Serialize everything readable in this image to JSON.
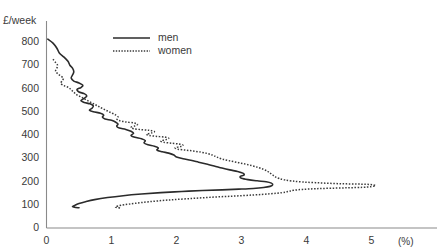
{
  "top_caption": "",
  "chart_data": {
    "type": "line",
    "title": "",
    "xlabel": "(%)",
    "ylabel": "£/week",
    "xlim": [
      0,
      5.6
    ],
    "ylim": [
      0,
      850
    ],
    "grid": false,
    "legend_position": "top-center",
    "x_ticks": [
      {
        "value": 0,
        "label": "0"
      },
      {
        "value": 1,
        "label": "1"
      },
      {
        "value": 2,
        "label": "2"
      },
      {
        "value": 3,
        "label": "3"
      },
      {
        "value": 4,
        "label": "4"
      },
      {
        "value": 5,
        "label": "5"
      }
    ],
    "y_ticks": [
      {
        "value": 0,
        "label": "0"
      },
      {
        "value": 100,
        "label": "100"
      },
      {
        "value": 200,
        "label": "200"
      },
      {
        "value": 300,
        "label": "300"
      },
      {
        "value": 400,
        "label": "400"
      },
      {
        "value": 500,
        "label": "500"
      },
      {
        "value": 600,
        "label": "600"
      },
      {
        "value": 700,
        "label": "700"
      },
      {
        "value": 800,
        "label": "800"
      }
    ],
    "series": [
      {
        "name": "men",
        "style": "solid",
        "color": "#2b2b2b",
        "points": [
          [
            0.02,
            812
          ],
          [
            0.1,
            795
          ],
          [
            0.16,
            773
          ],
          [
            0.2,
            752
          ],
          [
            0.27,
            735
          ],
          [
            0.33,
            717
          ],
          [
            0.36,
            700
          ],
          [
            0.4,
            688
          ],
          [
            0.42,
            672
          ],
          [
            0.4,
            658
          ],
          [
            0.38,
            645
          ],
          [
            0.42,
            632
          ],
          [
            0.5,
            624
          ],
          [
            0.56,
            614
          ],
          [
            0.53,
            604
          ],
          [
            0.47,
            596
          ],
          [
            0.5,
            585
          ],
          [
            0.58,
            578
          ],
          [
            0.62,
            568
          ],
          [
            0.58,
            558
          ],
          [
            0.53,
            548
          ],
          [
            0.58,
            540
          ],
          [
            0.67,
            534
          ],
          [
            0.72,
            525
          ],
          [
            0.7,
            515
          ],
          [
            0.66,
            507
          ],
          [
            0.72,
            500
          ],
          [
            0.83,
            494
          ],
          [
            0.88,
            486
          ],
          [
            0.86,
            477
          ],
          [
            0.9,
            469
          ],
          [
            1.0,
            463
          ],
          [
            1.06,
            456
          ],
          [
            1.1,
            447
          ],
          [
            1.08,
            438
          ],
          [
            1.12,
            430
          ],
          [
            1.22,
            424
          ],
          [
            1.3,
            416
          ],
          [
            1.34,
            407
          ],
          [
            1.3,
            398
          ],
          [
            1.36,
            390
          ],
          [
            1.46,
            384
          ],
          [
            1.52,
            376
          ],
          [
            1.5,
            366
          ],
          [
            1.56,
            358
          ],
          [
            1.66,
            352
          ],
          [
            1.72,
            344
          ],
          [
            1.7,
            335
          ],
          [
            1.78,
            328
          ],
          [
            1.88,
            322
          ],
          [
            1.96,
            314
          ],
          [
            2.0,
            305
          ],
          [
            2.1,
            298
          ],
          [
            2.22,
            291
          ],
          [
            2.34,
            283
          ],
          [
            2.46,
            275
          ],
          [
            2.58,
            267
          ],
          [
            2.7,
            258
          ],
          [
            2.82,
            250
          ],
          [
            2.94,
            243
          ],
          [
            3.02,
            236
          ],
          [
            3.04,
            228
          ],
          [
            2.98,
            221
          ],
          [
            3.0,
            214
          ],
          [
            3.1,
            208
          ],
          [
            3.24,
            203
          ],
          [
            3.38,
            199
          ],
          [
            3.46,
            193
          ],
          [
            3.48,
            186
          ],
          [
            3.44,
            179
          ],
          [
            3.34,
            174
          ],
          [
            3.18,
            170
          ],
          [
            2.96,
            167
          ],
          [
            2.7,
            164
          ],
          [
            2.4,
            161
          ],
          [
            2.08,
            157
          ],
          [
            1.76,
            152
          ],
          [
            1.46,
            146
          ],
          [
            1.18,
            139
          ],
          [
            0.94,
            131
          ],
          [
            0.74,
            122
          ],
          [
            0.6,
            113
          ],
          [
            0.5,
            105
          ],
          [
            0.44,
            98
          ],
          [
            0.4,
            93
          ],
          [
            0.43,
            89
          ],
          [
            0.5,
            87
          ]
        ]
      },
      {
        "name": "women",
        "style": "dotted",
        "color": "#3a3a3a",
        "points": [
          [
            0.1,
            726
          ],
          [
            0.14,
            712
          ],
          [
            0.17,
            700
          ],
          [
            0.16,
            688
          ],
          [
            0.14,
            676
          ],
          [
            0.17,
            664
          ],
          [
            0.22,
            654
          ],
          [
            0.26,
            644
          ],
          [
            0.24,
            633
          ],
          [
            0.22,
            622
          ],
          [
            0.27,
            612
          ],
          [
            0.34,
            604
          ],
          [
            0.38,
            594
          ],
          [
            0.42,
            584
          ],
          [
            0.46,
            574
          ],
          [
            0.52,
            565
          ],
          [
            0.58,
            556
          ],
          [
            0.64,
            547
          ],
          [
            0.7,
            538
          ],
          [
            0.76,
            529
          ],
          [
            0.82,
            520
          ],
          [
            0.88,
            511
          ],
          [
            0.94,
            503
          ],
          [
            1.0,
            495
          ],
          [
            1.06,
            487
          ],
          [
            1.1,
            478
          ],
          [
            1.08,
            470
          ],
          [
            1.12,
            462
          ],
          [
            1.22,
            456
          ],
          [
            1.34,
            452
          ],
          [
            1.4,
            446
          ],
          [
            1.36,
            439
          ],
          [
            1.3,
            433
          ],
          [
            1.34,
            427
          ],
          [
            1.46,
            423
          ],
          [
            1.58,
            420
          ],
          [
            1.66,
            415
          ],
          [
            1.62,
            409
          ],
          [
            1.54,
            404
          ],
          [
            1.58,
            398
          ],
          [
            1.7,
            394
          ],
          [
            1.82,
            391
          ],
          [
            1.88,
            386
          ],
          [
            1.84,
            380
          ],
          [
            1.76,
            375
          ],
          [
            1.8,
            369
          ],
          [
            1.92,
            365
          ],
          [
            2.04,
            361
          ],
          [
            2.1,
            356
          ],
          [
            2.06,
            350
          ],
          [
            1.98,
            345
          ],
          [
            2.02,
            339
          ],
          [
            2.14,
            335
          ],
          [
            2.26,
            331
          ],
          [
            2.38,
            326
          ],
          [
            2.48,
            320
          ],
          [
            2.56,
            313
          ],
          [
            2.62,
            305
          ],
          [
            2.7,
            297
          ],
          [
            2.8,
            290
          ],
          [
            2.92,
            283
          ],
          [
            3.04,
            276
          ],
          [
            3.16,
            268
          ],
          [
            3.26,
            260
          ],
          [
            3.34,
            252
          ],
          [
            3.4,
            244
          ],
          [
            3.44,
            236
          ],
          [
            3.48,
            228
          ],
          [
            3.52,
            220
          ],
          [
            3.58,
            213
          ],
          [
            3.66,
            207
          ],
          [
            3.78,
            202
          ],
          [
            3.94,
            198
          ],
          [
            4.14,
            195
          ],
          [
            4.36,
            192
          ],
          [
            4.58,
            190
          ],
          [
            4.78,
            189
          ],
          [
            4.92,
            188
          ],
          [
            5.02,
            186
          ],
          [
            5.06,
            182
          ],
          [
            5.0,
            178
          ],
          [
            4.86,
            175
          ],
          [
            4.64,
            173
          ],
          [
            4.38,
            171
          ],
          [
            4.14,
            169
          ],
          [
            3.94,
            166
          ],
          [
            3.8,
            162
          ],
          [
            3.72,
            157
          ],
          [
            3.62,
            152
          ],
          [
            3.44,
            147
          ],
          [
            3.18,
            142
          ],
          [
            2.86,
            137
          ],
          [
            2.52,
            132
          ],
          [
            2.18,
            126
          ],
          [
            1.86,
            120
          ],
          [
            1.58,
            113
          ],
          [
            1.36,
            106
          ],
          [
            1.2,
            100
          ],
          [
            1.1,
            95
          ],
          [
            1.06,
            91
          ],
          [
            1.08,
            88
          ],
          [
            1.14,
            86
          ]
        ]
      }
    ]
  },
  "legend": {
    "men_label": "men",
    "women_label": "women"
  }
}
